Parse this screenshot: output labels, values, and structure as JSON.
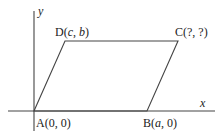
{
  "diagram": {
    "type": "parallelogram-on-coordinate-plane",
    "axes": {
      "x_label": "x",
      "y_label": "y"
    },
    "vertices": [
      {
        "name": "A",
        "coords": "(0, 0)",
        "label_prefix": "A(",
        "label_parts": [
          "0",
          "0"
        ]
      },
      {
        "name": "B",
        "coords": "(a, 0)",
        "label_prefix": "B(",
        "label_parts": [
          "a",
          "0"
        ]
      },
      {
        "name": "C",
        "coords": "(?, ?)",
        "label_prefix": "C(",
        "label_parts": [
          "?",
          "?"
        ]
      },
      {
        "name": "D",
        "coords": "(c, b)",
        "label_prefix": "D(",
        "label_parts": [
          "c",
          "b"
        ]
      }
    ],
    "colors": {
      "line": "#444444",
      "text": "#222222",
      "background": "#ffffff"
    }
  }
}
